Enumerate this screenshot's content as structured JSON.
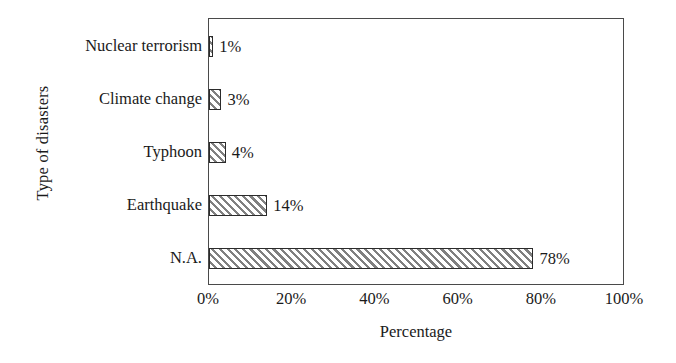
{
  "chart_data": {
    "type": "bar",
    "orientation": "horizontal",
    "title": "",
    "xlabel": "Percentage",
    "ylabel": "Type of disasters",
    "categories": [
      "Nuclear terrorism",
      "Climate change",
      "Typhoon",
      "Earthquake",
      "N.A."
    ],
    "values": [
      1,
      3,
      4,
      14,
      78
    ],
    "value_labels": [
      "1%",
      "3%",
      "4%",
      "14%",
      "78%"
    ],
    "xlim": [
      0,
      100
    ],
    "xticks": [
      0,
      20,
      40,
      60,
      80,
      100
    ],
    "xtick_labels": [
      "0%",
      "20%",
      "40%",
      "60%",
      "80%",
      "100%"
    ],
    "grid": false,
    "legend": false,
    "series_fill": "diagonal-hatch",
    "colors": {
      "frame": "#4a4a4a",
      "bar_border": "#2b2b2b",
      "bar_hatch": "#808080",
      "background": "#ffffff",
      "text": "#1a1a1a"
    }
  }
}
